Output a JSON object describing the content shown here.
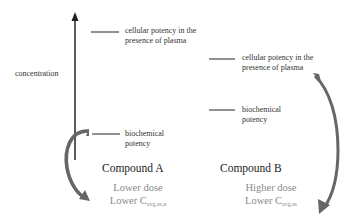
{
  "diagram": {
    "axis": {
      "label": "concentration"
    },
    "compound_a": {
      "title": "Compound A",
      "dose": "Lower dose",
      "cavg_prefix": "Lower C",
      "cavg_subscript": "avg,ss,u",
      "levels": {
        "cellular": {
          "line1": "cellular potency in the",
          "line2": "presence of plasma"
        },
        "biochemical": {
          "line1": "biochemical",
          "line2": "potency"
        }
      }
    },
    "compound_b": {
      "title": "Compound B",
      "dose": "Higher dose",
      "cavg_prefix": "Lower C",
      "cavg_subscript": "avg,ss",
      "levels": {
        "cellular": {
          "line1": "cellular potency in the",
          "line2": "presence of plasma"
        },
        "biochemical": {
          "line1": "biochemical",
          "line2": "potency"
        }
      }
    },
    "colors": {
      "axis": "#333333",
      "level_line": "#555555",
      "curved_arrow": "#666666",
      "dose_text": "#8a8a8a"
    }
  }
}
